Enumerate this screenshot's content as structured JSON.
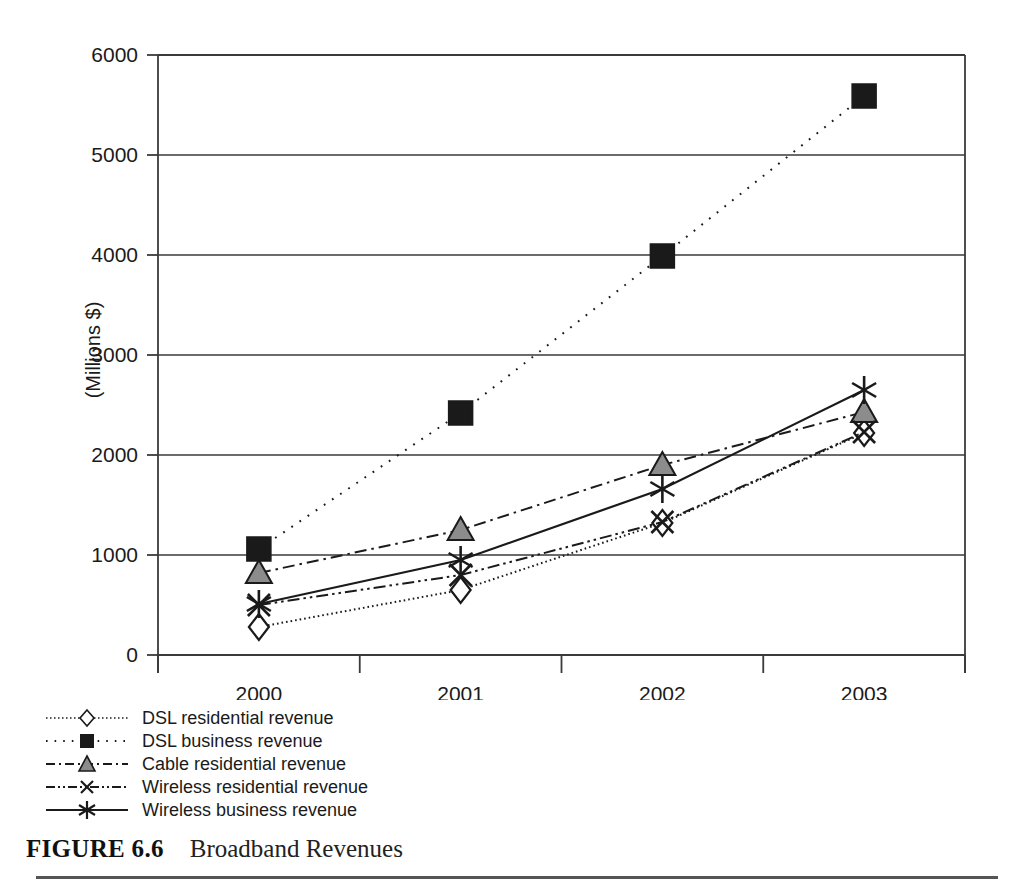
{
  "caption": {
    "figure_number": "FIGURE 6.6",
    "title": "Broadband Revenues"
  },
  "axes": {
    "y_title": "(Millions $)",
    "y_ticks": [
      "0",
      "1000",
      "2000",
      "3000",
      "4000",
      "5000",
      "6000"
    ],
    "x_ticks": [
      "2000",
      "2001",
      "2002",
      "2003"
    ]
  },
  "legend": {
    "items": [
      {
        "label": "DSL residential revenue",
        "marker": "diamond-open",
        "line": "dotted"
      },
      {
        "label": "DSL business revenue",
        "marker": "square-filled",
        "line": "dotted-sparse"
      },
      {
        "label": "Cable residential revenue",
        "marker": "triangle-filled",
        "line": "dash-dot"
      },
      {
        "label": "Wireless residential revenue",
        "marker": "x-mark",
        "line": "dash-dot-dot"
      },
      {
        "label": "Wireless business revenue",
        "marker": "asterisk",
        "line": "solid"
      }
    ]
  },
  "chart_data": {
    "type": "line",
    "title": "Broadband Revenues",
    "xlabel": "",
    "ylabel": "(Millions $)",
    "categories": [
      "2000",
      "2001",
      "2002",
      "2003"
    ],
    "ylim": [
      0,
      6000
    ],
    "yticks": [
      0,
      1000,
      2000,
      3000,
      4000,
      5000,
      6000
    ],
    "grid": true,
    "legend_position": "below-left",
    "series": [
      {
        "name": "DSL residential revenue",
        "marker": "diamond-open",
        "line": "dotted",
        "values": [
          280,
          650,
          1320,
          2220
        ]
      },
      {
        "name": "DSL business revenue",
        "marker": "square-filled",
        "line": "dotted-sparse",
        "values": [
          1060,
          2420,
          3990,
          5590
        ]
      },
      {
        "name": "Cable residential revenue",
        "marker": "triangle-filled",
        "line": "dash-dot",
        "values": [
          820,
          1250,
          1900,
          2430
        ]
      },
      {
        "name": "Wireless residential revenue",
        "marker": "x-mark",
        "line": "dash-dot-dot",
        "values": [
          500,
          800,
          1330,
          2230
        ]
      },
      {
        "name": "Wireless business revenue",
        "marker": "asterisk",
        "line": "solid",
        "values": [
          510,
          950,
          1660,
          2650
        ]
      }
    ]
  },
  "colors": {
    "ink": "#1a1a1a",
    "axis": "#3a3a3a",
    "marker_fill": "#8c8c8c",
    "square_fill": "#1a1a1a"
  }
}
